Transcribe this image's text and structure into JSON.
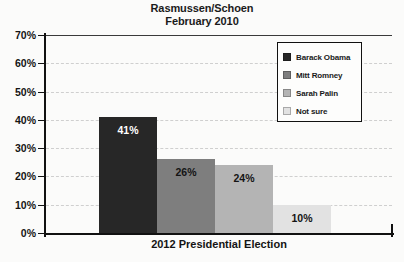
{
  "chart_data": {
    "type": "bar",
    "title": "Rasmussen/Schoen",
    "subtitle": "February 2010",
    "xlabel": "2012 Presidential Election",
    "ylabel": "",
    "ylim": [
      0,
      70
    ],
    "ytick_labels": [
      "70%",
      "60%",
      "50%",
      "40%",
      "30%",
      "20%",
      "10%",
      "0%"
    ],
    "ytick_values": [
      70,
      60,
      50,
      40,
      30,
      20,
      10,
      0
    ],
    "grid": true,
    "legend_position": "top-right",
    "categories": [
      "Barack Obama",
      "Mitt Romney",
      "Sarah Palin",
      "Not sure"
    ],
    "values": [
      41,
      26,
      24,
      10
    ],
    "data_labels": [
      "41%",
      "26%",
      "24%",
      "10%"
    ],
    "colors": [
      "#272727",
      "#7e7e7e",
      "#b4b4b4",
      "#e2e2e2"
    ],
    "label_colors": [
      "#ffffff",
      "#141414",
      "#141414",
      "#141414"
    ]
  },
  "legend": {
    "items": [
      {
        "label": "Barack Obama",
        "color": "#272727"
      },
      {
        "label": "Mitt Romney",
        "color": "#7e7e7e"
      },
      {
        "label": "Sarah Palin",
        "color": "#b4b4b4"
      },
      {
        "label": "Not sure",
        "color": "#e2e2e2"
      }
    ]
  }
}
